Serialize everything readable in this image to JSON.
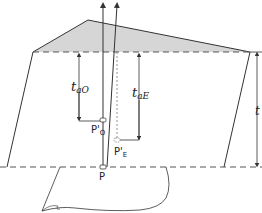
{
  "diagram": {
    "labels": {
      "t_ao": "t",
      "t_ao_sub": "aO",
      "t_ae": "t",
      "t_ae_sub": "aE",
      "t": "t",
      "p_o": "P'",
      "p_o_sub": "O",
      "p_e": "P'",
      "p_e_sub": "E",
      "p": "P"
    },
    "colors": {
      "line": "#333333",
      "shade": "#d6d6d6",
      "dash": "#555555"
    }
  }
}
